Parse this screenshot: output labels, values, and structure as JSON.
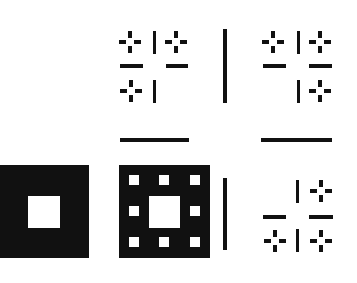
{
  "figure": {
    "title": "Sierpinski carpet construction stages",
    "colors": {
      "ink": "#111111",
      "background": "#ffffff"
    }
  },
  "panels": [
    {
      "id": "stage-1-square",
      "label": "Stage 1: square with center hole",
      "box": [
        0,
        165,
        89,
        93
      ],
      "holes": [
        [
          28,
          31,
          32,
          32
        ]
      ]
    },
    {
      "id": "stage-2-square",
      "label": "Stage 2: square with center hole and 8 sub-holes",
      "box": [
        119,
        165,
        91,
        93
      ],
      "holes": [
        [
          10,
          10,
          10,
          10
        ],
        [
          40,
          10,
          10,
          10
        ],
        [
          71,
          10,
          10,
          10
        ],
        [
          10,
          41,
          10,
          10
        ],
        [
          71,
          41,
          10,
          10
        ],
        [
          10,
          72,
          10,
          10
        ],
        [
          40,
          72,
          10,
          10
        ],
        [
          71,
          72,
          10,
          10
        ],
        [
          30,
          31,
          31,
          32
        ]
      ]
    }
  ],
  "lines": [
    {
      "id": "divider-vertical-top",
      "rect": [
        223,
        29,
        4,
        74
      ]
    },
    {
      "id": "divider-vertical-bottom",
      "rect": [
        223,
        178,
        4,
        72
      ]
    },
    {
      "id": "divider-horizontal-left",
      "rect": [
        120,
        138,
        69,
        4
      ]
    },
    {
      "id": "divider-horizontal-right",
      "rect": [
        261,
        138,
        71,
        4
      ]
    }
  ],
  "motifs": [
    {
      "id": "motif-top-left",
      "crosses": [
        [
          130,
          42
        ],
        [
          176,
          42
        ],
        [
          131,
          91
        ]
      ],
      "vbars": [
        [
          153,
          31,
          3,
          23
        ],
        [
          153,
          80,
          3,
          23
        ]
      ],
      "hbars": [
        [
          120,
          64,
          23,
          4
        ],
        [
          166,
          64,
          22,
          4
        ]
      ]
    },
    {
      "id": "motif-top-right",
      "crosses": [
        [
          273,
          42
        ],
        [
          320,
          42
        ],
        [
          320,
          91
        ]
      ],
      "vbars": [
        [
          297,
          31,
          3,
          23
        ],
        [
          297,
          80,
          3,
          23
        ]
      ],
      "hbars": [
        [
          263,
          64,
          23,
          4
        ],
        [
          309,
          64,
          23,
          4
        ]
      ]
    },
    {
      "id": "motif-bottom-right",
      "crosses": [
        [
          321,
          191
        ],
        [
          275,
          241
        ],
        [
          321,
          241
        ]
      ],
      "vbars": [
        [
          296,
          180,
          3,
          23
        ],
        [
          296,
          229,
          3,
          23
        ]
      ],
      "hbars": [
        [
          263,
          215,
          23,
          4
        ],
        [
          309,
          215,
          24,
          4
        ]
      ]
    }
  ]
}
